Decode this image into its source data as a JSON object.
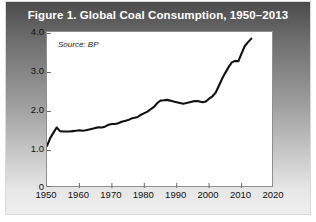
{
  "figure": {
    "title": "Figure 1. Global Coal Consumption, 1950–2013",
    "source_note": "Source: BP",
    "accent_color": "#111111",
    "panel_gradient_top": "#4b4b4b",
    "panel_gradient_bottom": "#efefef",
    "line_color": "#111111",
    "plot_background": "#ffffff"
  },
  "chart_data": {
    "type": "line",
    "title": "Figure 1. Global Coal Consumption, 1950–2013",
    "subtitle": "Source: BP",
    "xlabel": "",
    "ylabel": "Billion Tons of Oil Equivalent",
    "xlim": [
      1950,
      2020
    ],
    "ylim": [
      0,
      4.0
    ],
    "xticks": [
      1950,
      1960,
      1970,
      1980,
      1990,
      2000,
      2010,
      2020
    ],
    "xtick_labels": [
      "1950",
      "1960",
      "1970",
      "1980",
      "1990",
      "2000",
      "2010",
      "2020"
    ],
    "yticks": [
      0,
      1.0,
      2.0,
      3.0,
      4.0
    ],
    "ytick_labels": [
      "0",
      "1.0",
      "2.0",
      "3.0",
      "4.0"
    ],
    "grid": false,
    "legend": false,
    "units": "Billion Tons of Oil Equivalent",
    "series": [
      {
        "name": "Global Coal Consumption",
        "color": "#111111",
        "x": [
          1950,
          1951,
          1952,
          1953,
          1954,
          1955,
          1956,
          1957,
          1958,
          1959,
          1960,
          1961,
          1962,
          1963,
          1964,
          1965,
          1966,
          1967,
          1968,
          1969,
          1970,
          1971,
          1972,
          1973,
          1974,
          1975,
          1976,
          1977,
          1978,
          1979,
          1980,
          1981,
          1982,
          1983,
          1984,
          1985,
          1986,
          1987,
          1988,
          1989,
          1990,
          1991,
          1992,
          1993,
          1994,
          1995,
          1996,
          1997,
          1998,
          1999,
          2000,
          2001,
          2002,
          2003,
          2004,
          2005,
          2006,
          2007,
          2008,
          2009,
          2010,
          2011,
          2012,
          2013
        ],
        "values": [
          1.08,
          1.28,
          1.42,
          1.55,
          1.46,
          1.45,
          1.45,
          1.45,
          1.46,
          1.47,
          1.48,
          1.47,
          1.48,
          1.5,
          1.52,
          1.54,
          1.56,
          1.55,
          1.58,
          1.62,
          1.64,
          1.64,
          1.66,
          1.7,
          1.72,
          1.74,
          1.78,
          1.8,
          1.82,
          1.88,
          1.92,
          1.96,
          2.02,
          2.08,
          2.18,
          2.24,
          2.25,
          2.26,
          2.24,
          2.22,
          2.2,
          2.18,
          2.16,
          2.18,
          2.2,
          2.22,
          2.23,
          2.22,
          2.2,
          2.22,
          2.29,
          2.35,
          2.44,
          2.62,
          2.8,
          2.96,
          3.1,
          3.22,
          3.26,
          3.25,
          3.45,
          3.64,
          3.74,
          3.83
        ]
      }
    ]
  }
}
